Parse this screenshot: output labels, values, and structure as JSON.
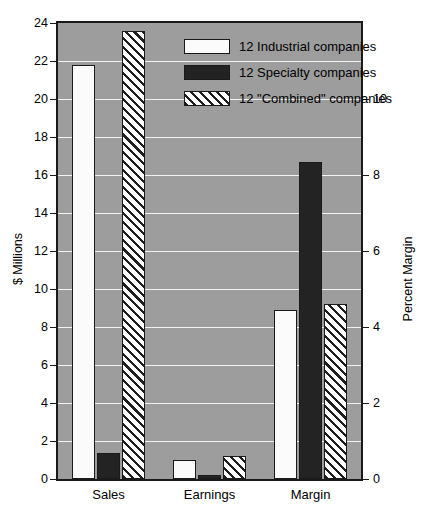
{
  "chart_data": {
    "type": "bar",
    "title": "",
    "categories": [
      "Sales",
      "Earnings",
      "Margin"
    ],
    "series": [
      {
        "name": "12 Industrial companies",
        "key": "industrial",
        "style": "white",
        "values": [
          21.8,
          1.0,
          4.45
        ],
        "axis": [
          "left",
          "left",
          "right"
        ]
      },
      {
        "name": "12 Specialty companies",
        "key": "specialty",
        "style": "black",
        "values": [
          1.35,
          0.2,
          8.35
        ],
        "axis": [
          "left",
          "left",
          "right"
        ]
      },
      {
        "name": "12 \"Combined\" companies",
        "key": "combined",
        "style": "hatched",
        "values": [
          23.6,
          1.2,
          4.6
        ],
        "axis": [
          "left",
          "left",
          "right"
        ]
      }
    ],
    "left_axis": {
      "label": "$ Millions",
      "ylim": [
        0,
        24
      ],
      "ticks": [
        0,
        2,
        4,
        6,
        8,
        10,
        12,
        14,
        16,
        18,
        20,
        22,
        24
      ],
      "ticklabels": [
        "0",
        "2",
        "4",
        "6",
        "8",
        "10",
        "12",
        "14",
        "16",
        "18",
        "20",
        "22",
        "24"
      ]
    },
    "right_axis": {
      "label": "Percent Margin",
      "ylim": [
        0,
        12
      ],
      "ticks": [
        0,
        2,
        4,
        6,
        8,
        10
      ],
      "ticklabels": [
        "0",
        "2",
        "4",
        "6",
        "8",
        "10"
      ]
    },
    "grid": true,
    "legend_position": "top-right",
    "colors": {
      "plot_background": "#9d9d9d",
      "page_background": "#ffffff",
      "gridline": "#f2f2f2",
      "frame": "#1a1a1a",
      "industrial_fill": "#fbfbfb",
      "specialty_fill": "#232323",
      "combined_fill": "#ffffff",
      "combined_hatch": "#1e1e1e",
      "text": "#000000"
    }
  },
  "legend": {
    "items": [
      {
        "label": "12 Industrial companies"
      },
      {
        "label": "12 Specialty companies"
      },
      {
        "label": "12 \"Combined\" companies"
      }
    ]
  }
}
